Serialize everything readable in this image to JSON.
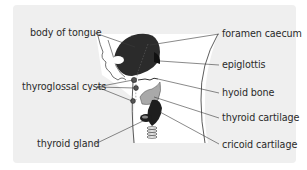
{
  "diagram": {
    "labels": {
      "body_of_tongue": "body of tongue",
      "foramen_caecum": "foramen caecum",
      "epiglottis": "epiglottis",
      "thyroglossal_cysts": "thyroglossal cysts",
      "hyoid_bone": "hyoid bone",
      "thyroid_cartilage": "thyroid cartilage",
      "thyroid_gland": "thyroid gland",
      "cricoid_cartilage": "cricoid cartilage"
    },
    "colors": {
      "panel_background": "#efefef",
      "drawing_area": "#ffffff",
      "tongue": "#2b2b2b",
      "cartilage_gray": "#a9a9a9",
      "gland_dark": "#1e1e1e",
      "leader_line": "#3a3a3a"
    }
  }
}
